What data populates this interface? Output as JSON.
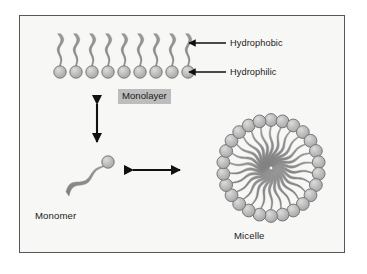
{
  "figure": {
    "background_color": "#f7f7f5",
    "border_color": "#55555a",
    "page_color": "#ffffff",
    "head_fill": "#b9b9b9",
    "head_stroke": "#6e6e6e",
    "tail_color": "#8a8a8a",
    "arrow_color": "#111111",
    "text_color": "#1b1b1b",
    "highlight_color": "#bdbdbd"
  },
  "labels": {
    "hydrophobic": "Hydrophobic",
    "hydrophilic": "Hydrophilic",
    "monolayer": "Monolayer",
    "monomer": "Monomer",
    "micelle": "Micelle"
  },
  "chart_data": {
    "type": "diagram",
    "structures": [
      {
        "name": "monolayer",
        "label": "Monolayer",
        "molecule_count": 9,
        "orientation": "heads-down-tails-up",
        "head_row_y": 72,
        "first_head_x": 60,
        "head_spacing": 16,
        "head_radius": 6.2,
        "tail_length": 32
      },
      {
        "name": "monomer",
        "label": "Monomer",
        "molecule_count": 1,
        "head_center": [
          108,
          162
        ],
        "head_radius": 6.2,
        "tail_direction": "down-left"
      },
      {
        "name": "micelle",
        "label": "Micelle",
        "molecule_count": 26,
        "center": [
          271,
          168
        ],
        "ring_radius": 48,
        "head_radius": 6.4,
        "orientation": "heads-out-tails-in"
      }
    ],
    "callouts": [
      {
        "label": "Hydrophobic",
        "points_to": "tail",
        "arrow": "left",
        "text_x": 230,
        "text_y": 40
      },
      {
        "label": "Hydrophilic",
        "points_to": "head",
        "arrow": "left",
        "text_x": 230,
        "text_y": 69
      }
    ],
    "equilibria": [
      {
        "name": "monomer-monolayer",
        "orientation": "vertical",
        "double_headed": true
      },
      {
        "name": "monomer-micelle",
        "orientation": "horizontal",
        "double_headed": true
      }
    ]
  }
}
